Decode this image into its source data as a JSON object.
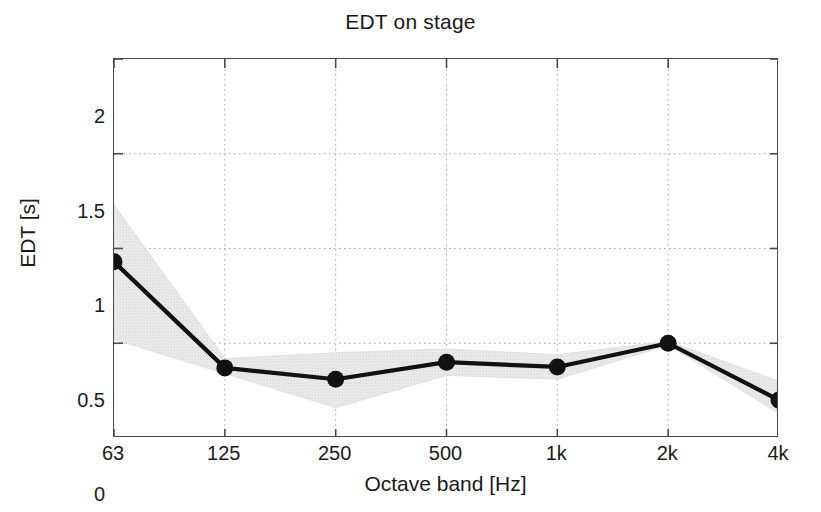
{
  "chart_data": {
    "type": "line",
    "title": "EDT on stage",
    "xlabel": "Octave band [Hz]",
    "ylabel": "EDT [s]",
    "categories": [
      "63",
      "125",
      "250",
      "500",
      "1k",
      "2k",
      "4k"
    ],
    "values": [
      0.93,
      0.37,
      0.31,
      0.4,
      0.375,
      0.5,
      0.2
    ],
    "band_upper": [
      1.23,
      0.42,
      0.45,
      0.47,
      0.44,
      0.51,
      0.3
    ],
    "band_lower": [
      0.52,
      0.34,
      0.16,
      0.33,
      0.31,
      0.49,
      0.13
    ],
    "xtick_labels": [
      "63",
      "125",
      "250",
      "500",
      "1k",
      "2k",
      "4k"
    ],
    "ytick_labels": [
      "0",
      "0.5",
      "1",
      "1.5",
      "2"
    ],
    "ytick_values": [
      0,
      0.5,
      1,
      1.5,
      2
    ],
    "ylim": [
      0,
      2
    ],
    "grid": true,
    "grid_style": "dotted",
    "legend": null,
    "series_name": "EDT on stage",
    "band_name": "standard deviation range",
    "colors": {
      "line": "#111111",
      "marker": "#111111",
      "band": "#e6e6e6",
      "grid": "#a8a8a8",
      "axis": "#4a4a4a",
      "text": "#1a1a1a",
      "background": "#ffffff"
    }
  }
}
